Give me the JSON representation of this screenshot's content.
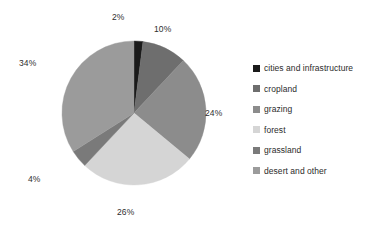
{
  "chart_data": {
    "type": "pie",
    "title": "",
    "legend_position": "right",
    "start_angle_deg": 0,
    "direction": "clockwise",
    "categories": [
      "cities and infrastructure",
      "cropland",
      "grazing",
      "forest",
      "grassland",
      "desert and other"
    ],
    "values": [
      2,
      10,
      24,
      26,
      4,
      34
    ],
    "value_labels": [
      "2%",
      "10%",
      "24%",
      "26%",
      "4%",
      "34%"
    ],
    "colors": [
      "#1a1a1a",
      "#6e6e6e",
      "#8c8c8c",
      "#d5d5d5",
      "#7a7a7a",
      "#9b9b9b"
    ],
    "units": "percent",
    "total": 100
  },
  "pie": {
    "slices": [
      {
        "name": "cities and infrastructure",
        "label": "2%",
        "value": 2,
        "color": "#1a1a1a",
        "label_x": 112,
        "label_y": 13
      },
      {
        "name": "cropland",
        "label": "10%",
        "value": 10,
        "color": "#6e6e6e",
        "label_x": 154,
        "label_y": 25
      },
      {
        "name": "grazing",
        "label": "24%",
        "value": 24,
        "color": "#8c8c8c",
        "label_x": 205,
        "label_y": 109
      },
      {
        "name": "forest",
        "label": "26%",
        "value": 26,
        "color": "#d5d5d5",
        "label_x": 117,
        "label_y": 208
      },
      {
        "name": "grassland",
        "label": "4%",
        "value": 4,
        "color": "#7a7a7a",
        "label_x": 28,
        "label_y": 175
      },
      {
        "name": "desert and other",
        "label": "34%",
        "value": 34,
        "color": "#9b9b9b",
        "label_x": 19,
        "label_y": 59
      }
    ]
  },
  "legend": {
    "items": [
      {
        "label": "cities and infrastructure",
        "color": "#1a1a1a"
      },
      {
        "label": "cropland",
        "color": "#6e6e6e"
      },
      {
        "label": "grazing",
        "color": "#8c8c8c"
      },
      {
        "label": "forest",
        "color": "#d5d5d5"
      },
      {
        "label": "grassland",
        "color": "#7a7a7a"
      },
      {
        "label": "desert and other",
        "color": "#9b9b9b"
      }
    ]
  }
}
